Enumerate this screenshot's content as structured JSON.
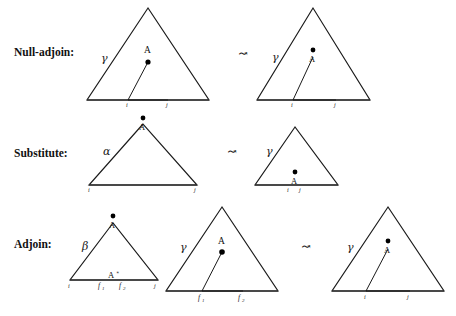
{
  "figure": {
    "background_color": "#ffffff",
    "ink_color": "#1a1a1a",
    "arrow_symbol": "↝"
  },
  "rows": [
    {
      "id": "null-adjoin",
      "label": "Null-adjoin:",
      "arrow": "↝",
      "diagrams": [
        {
          "id": "null-adjoin-before",
          "outer_label": "γ",
          "node_label": "A",
          "node_label_position": "above-dot",
          "has_dot": true,
          "inner_triangle": true,
          "span_labels": [
            "i",
            "j"
          ]
        },
        {
          "id": "null-adjoin-after",
          "outer_label": "γ",
          "node_label": "A",
          "node_label_position": "below-dot",
          "has_dot": true,
          "inner_triangle": true,
          "span_labels": [
            "i",
            "j"
          ]
        }
      ]
    },
    {
      "id": "substitute",
      "label": "Substitute:",
      "arrow": "↝",
      "diagrams": [
        {
          "id": "substitute-before",
          "outer_label": "α",
          "node_label": "A",
          "node_label_position": "apex-below-dot",
          "has_dot": true,
          "inner_triangle": false,
          "span_labels": [
            "i",
            "j"
          ]
        },
        {
          "id": "substitute-after",
          "outer_label": "γ",
          "node_label": "A",
          "node_label_position": "base-below-dot",
          "has_dot": true,
          "inner_triangle": false,
          "span_labels": [
            "i",
            "j"
          ]
        }
      ]
    },
    {
      "id": "adjoin",
      "label": "Adjoin:",
      "arrow": "↝",
      "diagrams": [
        {
          "id": "adjoin-auxiliary",
          "outer_label": "β",
          "node_label": "A",
          "node_label_position": "apex-below-dot",
          "foot_label": "A",
          "foot_star": "∗",
          "has_dot": true,
          "inner_triangle": false,
          "span_labels": [
            "i",
            "f",
            "f",
            "j"
          ],
          "span_subscripts": [
            "",
            "1",
            "2",
            ""
          ]
        },
        {
          "id": "adjoin-target",
          "outer_label": "γ",
          "node_label": "A",
          "node_label_position": "above-dot",
          "has_dot": true,
          "inner_triangle": true,
          "span_labels": [
            "f",
            "f"
          ],
          "span_subscripts": [
            "1",
            "2"
          ]
        },
        {
          "id": "adjoin-result",
          "outer_label": "γ",
          "node_label": "A",
          "node_label_position": "below-dot",
          "has_dot": true,
          "inner_triangle": true,
          "span_labels": [
            "i",
            "j"
          ]
        }
      ]
    }
  ]
}
